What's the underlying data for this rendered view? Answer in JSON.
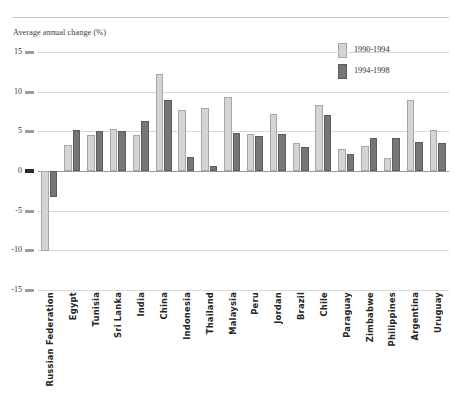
{
  "axis_title": "Average annual change (%)",
  "legend": {
    "position": "top-right",
    "entries": [
      {
        "label": "1990-1994",
        "color": "#d4d4d4"
      },
      {
        "label": "1994-1998",
        "color": "#767676"
      }
    ]
  },
  "y_axis": {
    "ticks": [
      "15",
      "10",
      "5",
      "0",
      "-5",
      "-10",
      "-15"
    ],
    "min": -15,
    "max": 15
  },
  "chart_data": {
    "type": "bar",
    "title": "",
    "subtitle": "",
    "xlabel": "",
    "ylabel": "Average annual change (%)",
    "ylim": [
      -15,
      15
    ],
    "yticks": [
      15,
      10,
      5,
      0,
      -5,
      -10,
      -15
    ],
    "grid": true,
    "legend_position": "top-right",
    "categories": [
      "Russian Federation",
      "Egypt",
      "Tunisia",
      "Sri Lanka",
      "India",
      "China",
      "Indonesia",
      "Thailand",
      "Malaysia",
      "Peru",
      "Jordan",
      "Brazil",
      "Chile",
      "Paraguay",
      "Zimbabwe",
      "Philippines",
      "Argentina",
      "Uruguay"
    ],
    "series": [
      {
        "name": "1990-1994",
        "color": "#d4d4d4",
        "values": [
          -10.1,
          3.3,
          4.5,
          5.3,
          4.6,
          12.2,
          7.7,
          8.0,
          9.3,
          4.7,
          7.2,
          3.5,
          8.3,
          2.8,
          3.2,
          1.7,
          8.9,
          5.2
        ]
      },
      {
        "name": "1994-1998",
        "color": "#767676",
        "values": [
          -3.3,
          5.2,
          5.0,
          5.1,
          6.3,
          8.9,
          1.8,
          0.6,
          4.8,
          4.4,
          4.7,
          3.0,
          7.0,
          2.2,
          4.2,
          4.2,
          3.7,
          3.5
        ]
      }
    ]
  }
}
